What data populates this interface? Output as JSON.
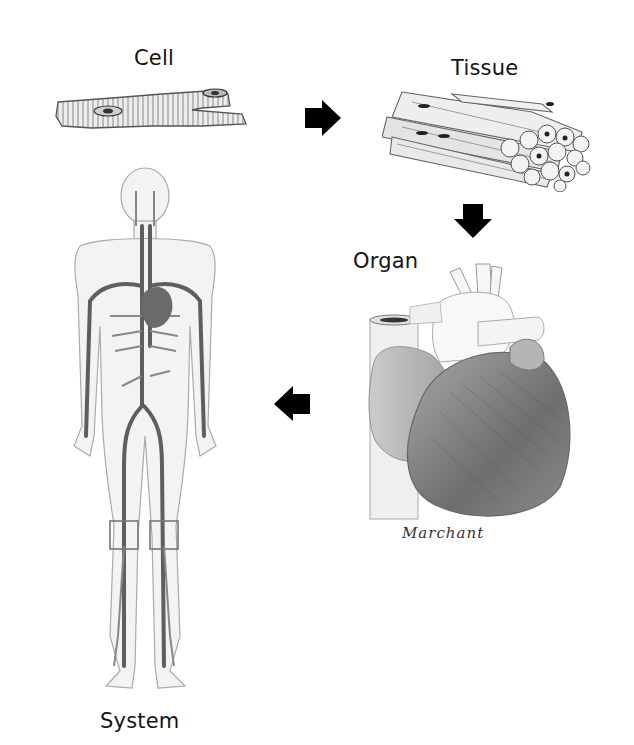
{
  "diagram": {
    "stages": [
      {
        "id": "cell",
        "label": "Cell",
        "illustration": "cardiac-muscle-cell"
      },
      {
        "id": "tissue",
        "label": "Tissue",
        "illustration": "muscle-fiber-bundle"
      },
      {
        "id": "organ",
        "label": "Organ",
        "illustration": "heart"
      },
      {
        "id": "system",
        "label": "System",
        "illustration": "circulatory-system-figure"
      }
    ],
    "arrows": [
      {
        "from": "cell",
        "to": "tissue",
        "direction": "right",
        "icon": "arrow-right-icon"
      },
      {
        "from": "tissue",
        "to": "organ",
        "direction": "down",
        "icon": "arrow-down-icon"
      },
      {
        "from": "organ",
        "to": "system",
        "direction": "left",
        "icon": "arrow-left-icon"
      }
    ],
    "signature": "Marchant",
    "colors": {
      "background": "#ffffff",
      "arrow": "#000000",
      "label": "#141414",
      "sketch_dark": "#555555",
      "sketch_light": "#d8d8d8"
    }
  }
}
